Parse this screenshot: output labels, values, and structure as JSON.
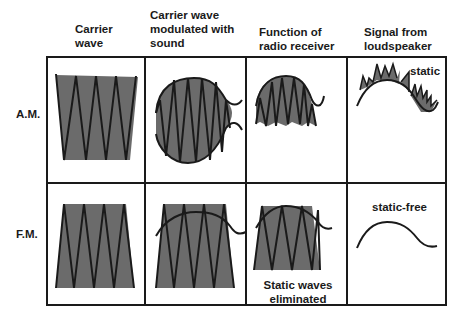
{
  "headers": {
    "col1": "Carrier\nwave",
    "col2": "Carrier wave\nmodulated with\nsound",
    "col3": "Function of\nradio receiver",
    "col4": "Signal from\nloudspeaker"
  },
  "rows": {
    "am": {
      "label": "A.M.",
      "signal_annotation": "static"
    },
    "fm": {
      "label": "F.M.",
      "receiver_annotation": "Static waves\neliminated",
      "signal_annotation": "static-free"
    }
  },
  "colors": {
    "fill": "#6b6b6b",
    "stroke": "#1a1a1a",
    "background": "#ffffff"
  }
}
